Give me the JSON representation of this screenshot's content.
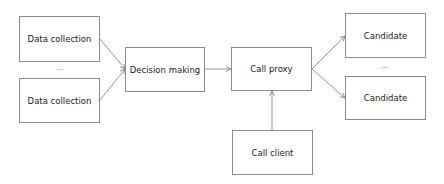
{
  "diagram": {
    "nodes": {
      "data_collection_1": "Data collection",
      "data_collection_2": "Data collection",
      "decision_making": "Decision making",
      "call_proxy": "Call proxy",
      "call_client": "Call client",
      "candidate_1": "Candidate",
      "candidate_2": "Candidate"
    },
    "ellipses": {
      "between_data_collection": "...",
      "between_candidates": "..."
    },
    "edges": [
      {
        "from": "Data collection (1)",
        "to": "Decision making"
      },
      {
        "from": "Data collection (2)",
        "to": "Decision making"
      },
      {
        "from": "Decision making",
        "to": "Call proxy"
      },
      {
        "from": "Call client",
        "to": "Call proxy"
      },
      {
        "from": "Call proxy",
        "to": "Candidate (1)"
      },
      {
        "from": "Call proxy",
        "to": "Candidate (2)"
      }
    ],
    "colors": {
      "stroke": "#8c8c8c",
      "text": "#222222",
      "background": "#ffffff"
    }
  }
}
